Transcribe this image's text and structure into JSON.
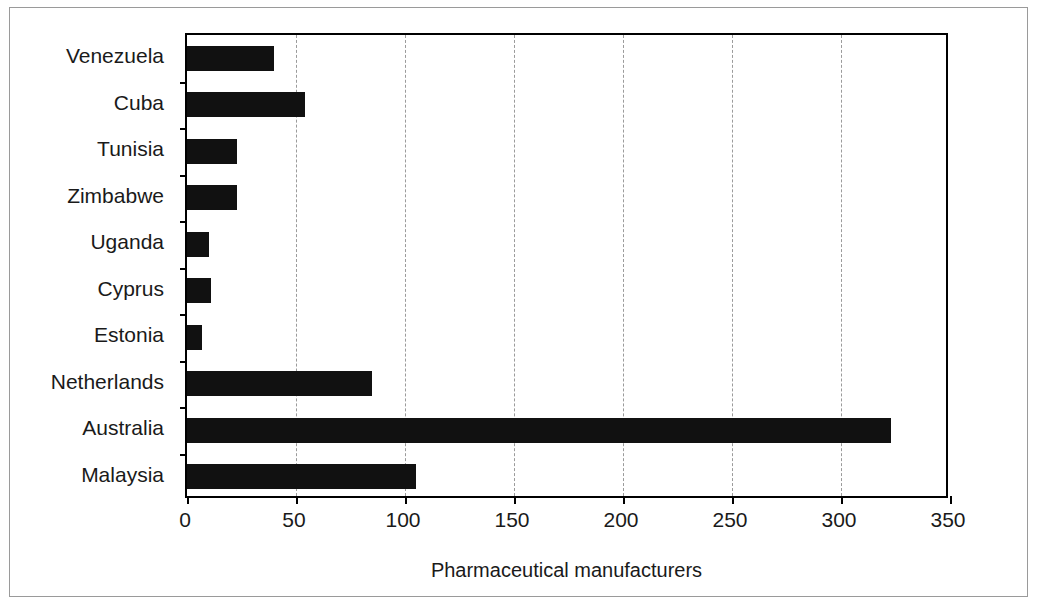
{
  "chart_data": {
    "type": "bar",
    "orientation": "horizontal",
    "title": "",
    "xlabel": "Pharmaceutical manufacturers",
    "ylabel": "",
    "xlim": [
      0,
      350
    ],
    "xticks": [
      0,
      50,
      100,
      150,
      200,
      250,
      300,
      350
    ],
    "xtick_labels": [
      "0",
      "50",
      "100",
      "150",
      "200",
      "250",
      "300",
      "350"
    ],
    "grid": "vertical dashed gridlines at each x tick",
    "legend": "none",
    "bar_color": "#111111",
    "categories": [
      "Venezuela",
      "Cuba",
      "Tunisia",
      "Zimbabwe",
      "Uganda",
      "Cyprus",
      "Estonia",
      "Netherlands",
      "Australia",
      "Malaysia"
    ],
    "values": [
      40,
      54,
      23,
      23,
      10,
      11,
      7,
      85,
      323,
      105
    ],
    "series": [
      {
        "name": "Pharmaceutical manufacturers",
        "values": [
          40,
          54,
          23,
          23,
          10,
          11,
          7,
          85,
          323,
          105
        ]
      }
    ]
  },
  "figure": {
    "background_color": "#ffffff",
    "frame_color": "#000000"
  }
}
